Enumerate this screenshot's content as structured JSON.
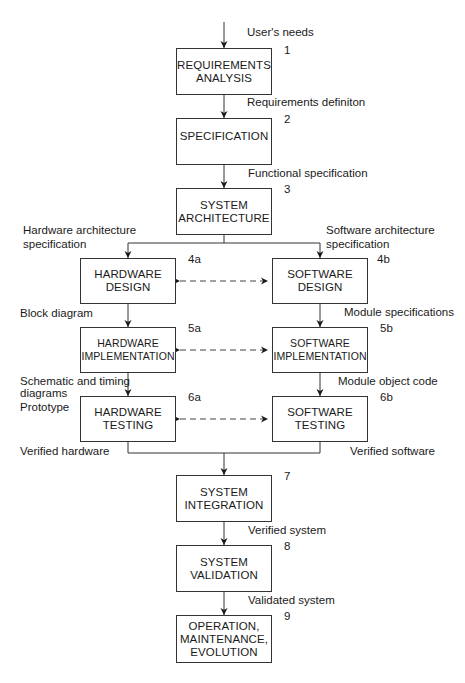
{
  "diagram": {
    "type": "flowchart",
    "boxes": [
      {
        "id": "1",
        "number": "1",
        "label": "REQUIREMENTS\nANALYSIS"
      },
      {
        "id": "2",
        "number": "2",
        "label": "SPECIFICATION"
      },
      {
        "id": "3",
        "number": "3",
        "label": "SYSTEM\nARCHITECTURE"
      },
      {
        "id": "4a",
        "number": "4a",
        "label": "HARDWARE\nDESIGN"
      },
      {
        "id": "4b",
        "number": "4b",
        "label": "SOFTWARE\nDESIGN"
      },
      {
        "id": "5a",
        "number": "5a",
        "label": "HARDWARE\nIMPLEMENTATION"
      },
      {
        "id": "5b",
        "number": "5b",
        "label": "SOFTWARE\nIMPLEMENTATION"
      },
      {
        "id": "6a",
        "number": "6a",
        "label": "HARDWARE\nTESTING"
      },
      {
        "id": "6b",
        "number": "6b",
        "label": "SOFTWARE\nTESTING"
      },
      {
        "id": "7",
        "number": "7",
        "label": "SYSTEM\nINTEGRATION"
      },
      {
        "id": "8",
        "number": "8",
        "label": "SYSTEM\nVALIDATION"
      },
      {
        "id": "9",
        "number": "9",
        "label": "OPERATION,\nMAINTENANCE,\nEVOLUTION"
      }
    ],
    "edge_labels": {
      "users_needs": "User's needs",
      "requirements_definition": "Requirements definiton",
      "functional_specification": "Functional specification",
      "hardware_architecture_spec": "Hardware architecture\n  specification",
      "software_architecture_spec": "Software architecture\n  specification",
      "block_diagram": "Block diagram",
      "module_specifications": "Module specifications",
      "schematic_timing": "Schematic and timing\ndiagrams",
      "prototype": "Prototype",
      "module_object_code": "Module object code",
      "verified_hardware": "Verified hardware",
      "verified_software": "Verified software",
      "verified_system": "Verified system",
      "validated_system": "Validated system"
    },
    "edges": [
      {
        "from": "input",
        "to": "1",
        "label": "User's needs"
      },
      {
        "from": "1",
        "to": "2",
        "label": "Requirements definiton"
      },
      {
        "from": "2",
        "to": "3",
        "label": "Functional specification"
      },
      {
        "from": "3",
        "to": "4a",
        "label": "Hardware architecture specification"
      },
      {
        "from": "3",
        "to": "4b",
        "label": "Software architecture specification"
      },
      {
        "from": "4a",
        "to": "5a",
        "label": "Block diagram"
      },
      {
        "from": "4b",
        "to": "5b",
        "label": "Module specifications"
      },
      {
        "from": "5a",
        "to": "6a",
        "label": "Schematic and timing diagrams"
      },
      {
        "from": "5b",
        "to": "6b",
        "label": "Module object code"
      },
      {
        "from": "6a",
        "to": "7",
        "label": "Verified hardware"
      },
      {
        "from": "6b",
        "to": "7",
        "label": "Verified software"
      },
      {
        "from": "7",
        "to": "8",
        "label": "Verified system"
      },
      {
        "from": "8",
        "to": "9",
        "label": "Validated system"
      },
      {
        "from": "4a",
        "to": "4b",
        "style": "dashed-bidirectional"
      },
      {
        "from": "5a",
        "to": "5b",
        "style": "dashed-bidirectional"
      },
      {
        "from": "6a",
        "to": "6b",
        "style": "dashed-bidirectional"
      }
    ]
  }
}
